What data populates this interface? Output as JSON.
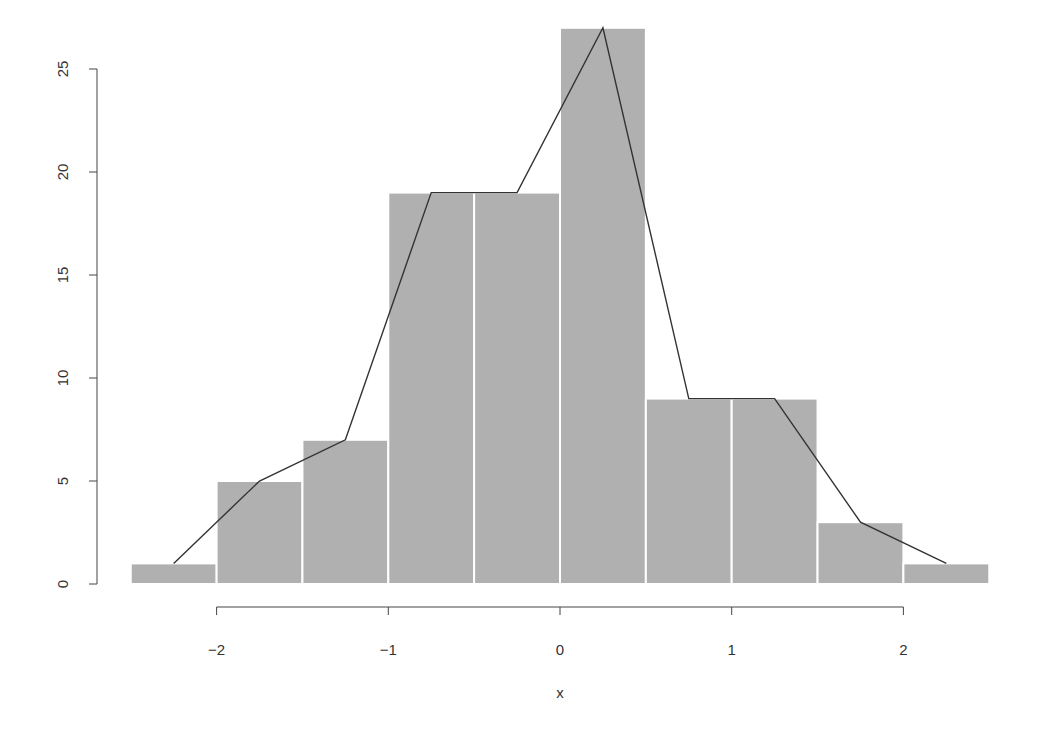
{
  "chart_data": {
    "type": "bar",
    "subtype": "histogram_with_frequency_polygon",
    "title": "",
    "xlabel": "x",
    "ylabel": "",
    "bin_edges": [
      -2.5,
      -2.0,
      -1.5,
      -1.0,
      -0.5,
      0.0,
      0.5,
      1.0,
      1.5,
      2.0,
      2.5
    ],
    "categories": [
      "[-2.5,-2)",
      "[-2,-1.5)",
      "[-1.5,-1)",
      "[-1,-0.5)",
      "[-0.5,0)",
      "[0,0.5)",
      "[0.5,1)",
      "[1,1.5)",
      "[1.5,2)",
      "[2,2.5]"
    ],
    "values": [
      1,
      5,
      7,
      19,
      19,
      27,
      9,
      9,
      3,
      1
    ],
    "series": [
      {
        "name": "histogram",
        "type": "bar",
        "values": [
          1,
          5,
          7,
          19,
          19,
          27,
          9,
          9,
          3,
          1
        ]
      },
      {
        "name": "frequency polygon",
        "type": "line",
        "x": [
          -2.25,
          -1.75,
          -1.25,
          -0.75,
          -0.25,
          0.25,
          0.75,
          1.25,
          1.75,
          2.25
        ],
        "values": [
          1,
          5,
          7,
          19,
          19,
          27,
          9,
          9,
          3,
          1
        ]
      }
    ],
    "xticks": [
      -2,
      -1,
      0,
      1,
      2
    ],
    "xtick_labels": [
      "−2",
      "−1",
      "0",
      "1",
      "2"
    ],
    "yticks": [
      0,
      5,
      10,
      15,
      20,
      25
    ],
    "ytick_labels": [
      "0",
      "5",
      "10",
      "15",
      "20",
      "25"
    ],
    "xlim": [
      -2.5,
      2.5
    ],
    "ylim": [
      0,
      27
    ],
    "grid": false,
    "legend": null,
    "colors": {
      "bar": "#b0b0b0",
      "bar_border": "#ffffff",
      "line": "#333333",
      "axis": "#444444"
    }
  }
}
